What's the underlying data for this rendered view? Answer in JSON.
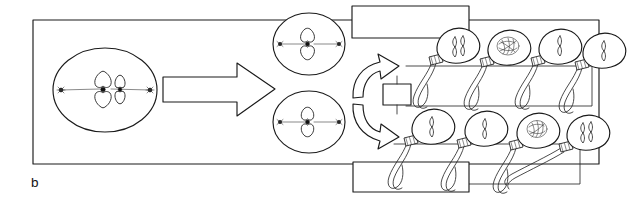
{
  "figure": {
    "panel_letter": "b",
    "title_visible": false,
    "background_color": "#ffffff",
    "ink_color": "#1a1a1a",
    "width": 639,
    "height": 215
  },
  "outer_frame": {
    "name": "outer-border-rectangle",
    "x": 33,
    "y": 20,
    "width": 566,
    "height": 144
  },
  "label_boxes": [
    {
      "id": "label-box-top",
      "text": "",
      "x": 352,
      "y": 6,
      "width": 117,
      "height": 32
    },
    {
      "id": "label-box-middle-small",
      "text": "",
      "x": 383,
      "y": 84,
      "width": 28,
      "height": 21
    },
    {
      "id": "label-box-bottom",
      "text": "",
      "x": 353,
      "y": 162,
      "width": 116,
      "height": 30
    }
  ],
  "stage_cells": [
    {
      "id": "primary-spermatocyte",
      "label": "",
      "cx": 105,
      "cy": 90,
      "rx": 52,
      "ry": 42,
      "chromosome_count": 2,
      "chromosome_shapes": [
        "large-x-chromosome",
        "small-x-chromosome"
      ],
      "spindle": true,
      "centrosomes": 2
    },
    {
      "id": "secondary-spermatocyte-upper",
      "label": "",
      "cx": 309,
      "cy": 44,
      "rx": 36,
      "ry": 31,
      "chromosome_count": 1,
      "chromosome_shapes": [
        "x-chromosome"
      ],
      "spindle": true,
      "centrosomes": 2
    },
    {
      "id": "secondary-spermatocyte-lower",
      "label": "",
      "cx": 309,
      "cy": 122,
      "rx": 36,
      "ry": 31,
      "chromosome_count": 1,
      "chromosome_shapes": [
        "x-chromosome"
      ],
      "spindle": true,
      "centrosomes": 2
    }
  ],
  "arrows": [
    {
      "id": "big-block-arrow-right",
      "direction": "right",
      "from": "primary-spermatocyte",
      "to": "secondary-spermatocytes"
    },
    {
      "id": "split-curved-arrow-upper",
      "direction": "up-right",
      "from": "secondary-spermatocyte",
      "to": "spermatid-row-top"
    },
    {
      "id": "split-curved-arrow-lower",
      "direction": "down-right",
      "from": "secondary-spermatocyte",
      "to": "spermatid-row-bottom"
    }
  ],
  "sperm_rows": [
    {
      "id": "spermatid-row-top",
      "row_index": 0,
      "cells": [
        {
          "id": "sperm-1",
          "nucleus": "two-rod-chromatids",
          "label": ""
        },
        {
          "id": "sperm-2",
          "nucleus": "dense-tangled-chromatin",
          "label": ""
        },
        {
          "id": "sperm-3",
          "nucleus": "single-rod-chromatid",
          "label": ""
        },
        {
          "id": "sperm-4",
          "nucleus": "single-rod-chromatid",
          "label": ""
        }
      ]
    },
    {
      "id": "spermatid-row-bottom",
      "row_index": 1,
      "cells": [
        {
          "id": "sperm-5",
          "nucleus": "single-rod-chromatid",
          "label": ""
        },
        {
          "id": "sperm-6",
          "nucleus": "single-rod-chromatid",
          "label": ""
        },
        {
          "id": "sperm-7",
          "nucleus": "dense-tangled-chromatin",
          "label": ""
        },
        {
          "id": "sperm-8",
          "nucleus": "two-rod-chromatids",
          "label": ""
        }
      ]
    }
  ],
  "bracket_boxes": [
    {
      "id": "bracket-top-row",
      "x": 406,
      "y": 66,
      "width": 186,
      "height": 40
    },
    {
      "id": "bracket-bottom-row",
      "x": 394,
      "y": 144,
      "width": 186,
      "height": 40
    }
  ]
}
